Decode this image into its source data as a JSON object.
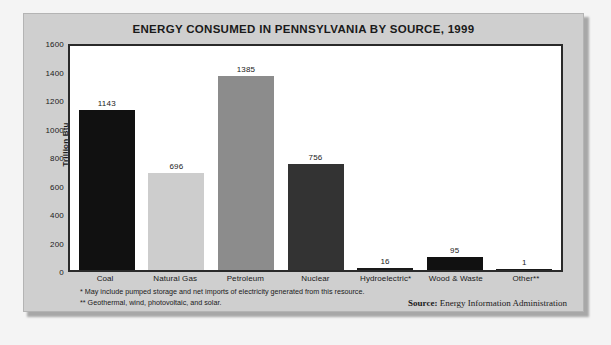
{
  "chart_data": {
    "type": "bar",
    "title": "ENERGY CONSUMED IN PENNSYLVANIA BY SOURCE, 1999",
    "xlabel": "",
    "ylabel": "Trillion Btu",
    "ylim": [
      0,
      1600
    ],
    "yticks": [
      1600,
      1400,
      1200,
      1000,
      800,
      600,
      400,
      200,
      0
    ],
    "grid": false,
    "legend": "none",
    "categories": [
      "Coal",
      "Natural Gas",
      "Petroleum",
      "Nuclear",
      "Hydroelectric*",
      "Wood & Waste",
      "Other**"
    ],
    "values": [
      1143,
      696,
      1385,
      756,
      16,
      95,
      1
    ],
    "bar_colors": [
      "#111111",
      "#cdcdcd",
      "#8c8c8c",
      "#333333",
      "#1a1a1a",
      "#111111",
      "#1a1a1a"
    ]
  },
  "footnotes": {
    "line1": "* May include pumped storage and net imports of electricity generated from this resource.",
    "line2": "** Geothermal, wind, photovoltaic, and solar."
  },
  "source": {
    "label": "Source:",
    "text": " Energy Information Administration"
  }
}
